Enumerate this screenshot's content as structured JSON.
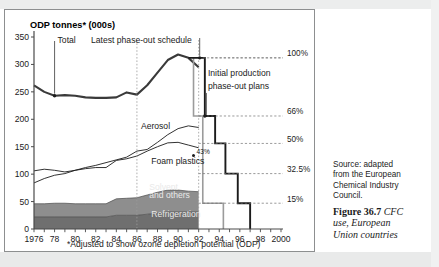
{
  "figure": {
    "axis_title": "ODP tonnes* (000s)",
    "footnote": "*Adjusted to show ozone depletion potential (ODP)"
  },
  "caption": {
    "source_line1": "Source:  adapted",
    "source_line2": "from the European",
    "source_line3": "Chemical Industry",
    "source_line4": "Council.",
    "figure_number": "Figure 36.7",
    "figure_title_line1": "CFC",
    "figure_title_line2": "use, European",
    "figure_title_line3": "Union countries"
  },
  "annotations": {
    "total": "Total",
    "latest_schedule": "Latest phase-out schedule",
    "initial_plans_line1": "Initial production",
    "initial_plans_line2": "phase-out plans",
    "aerosol": "Aerosol",
    "foam_plastics": "Foam plastics",
    "solvent_line1": "Solvent",
    "solvent_line2": "and others",
    "refrigeration": "Refrigeration",
    "pct_43": "43%"
  },
  "colors": {
    "total_line": "#3a3a3a",
    "series_line": "#1b1b1b",
    "solvent_fill": "#8e8e8e",
    "refrigeration_fill": "#6f6f6f",
    "latest_step": "#1b1b1b",
    "initial_step": "#9b9b9b",
    "axis": "#4a4a4a",
    "gridline": "#8d8f90"
  },
  "chart_data": {
    "type": "area",
    "title": "CFC use, European Union countries",
    "xlabel": "",
    "ylabel": "ODP tonnes* (000s)",
    "xlim": [
      1976,
      2000
    ],
    "ylim": [
      0,
      350
    ],
    "ytick_labels": [
      "0",
      "50",
      "100",
      "150",
      "200",
      "250",
      "300",
      "350"
    ],
    "ytick_values": [
      0,
      50,
      100,
      150,
      200,
      250,
      300,
      350
    ],
    "xtick_labels": [
      "1976",
      "78",
      "80",
      "82",
      "84",
      "86",
      "88",
      "90",
      "92",
      "94",
      "96",
      "98",
      "2000"
    ],
    "xtick_values": [
      1976,
      1978,
      1980,
      1982,
      1984,
      1986,
      1988,
      1990,
      1992,
      1994,
      1996,
      1998,
      2000
    ],
    "grid": false,
    "legend_position": "inline-labels",
    "right_axis_labels": [
      {
        "label": "100%",
        "value": 312
      },
      {
        "label": "66%",
        "value": 206
      },
      {
        "label": "50%",
        "value": 156
      },
      {
        "label": "32.5%",
        "value": 101
      },
      {
        "label": "15%",
        "value": 47
      }
    ],
    "x": [
      1976,
      1977,
      1978,
      1979,
      1980,
      1981,
      1982,
      1983,
      1984,
      1985,
      1986,
      1987,
      1988,
      1989,
      1990,
      1991,
      1992
    ],
    "series": [
      {
        "name": "Total",
        "values": [
          262,
          250,
          243,
          244,
          243,
          240,
          239,
          239,
          240,
          249,
          245,
          262,
          285,
          308,
          318,
          312,
          295
        ]
      },
      {
        "name": "Aerosol",
        "values": [
          84,
          92,
          98,
          101,
          107,
          112,
          116,
          121,
          126,
          131,
          142,
          145,
          158,
          172,
          183,
          188,
          185
        ]
      },
      {
        "name": "Foam plastics",
        "values": [
          60,
          63,
          60,
          57,
          61,
          64,
          66,
          66,
          70,
          72,
          76,
          80,
          83,
          86,
          87,
          84,
          80
        ]
      },
      {
        "name": "Solvent and others",
        "values": [
          24,
          24,
          25,
          25,
          24,
          24,
          24,
          24,
          30,
          31,
          32,
          35,
          38,
          40,
          40,
          38,
          37
        ]
      },
      {
        "name": "Refrigeration",
        "values": [
          22,
          22,
          22,
          22,
          22,
          22,
          22,
          22,
          25,
          25,
          25,
          27,
          29,
          31,
          31,
          31,
          31
        ]
      }
    ],
    "latest_phase_out_schedule": {
      "name": "Latest phase-out schedule",
      "steps": [
        {
          "year": 1991.0,
          "value": 312
        },
        {
          "year": 1992.6,
          "value": 312
        },
        {
          "year": 1992.6,
          "value": 206
        },
        {
          "year": 1993.6,
          "value": 206
        },
        {
          "year": 1993.6,
          "value": 156
        },
        {
          "year": 1994.6,
          "value": 156
        },
        {
          "year": 1994.6,
          "value": 101
        },
        {
          "year": 1995.8,
          "value": 101
        },
        {
          "year": 1995.8,
          "value": 47
        },
        {
          "year": 1997.0,
          "value": 47
        },
        {
          "year": 1997.0,
          "value": 0
        }
      ]
    },
    "initial_production_phase_out_plans": {
      "name": "Initial production phase-out plans",
      "steps": [
        {
          "year": 1991.5,
          "value": 312
        },
        {
          "year": 1991.5,
          "value": 206
        },
        {
          "year": 1992.4,
          "value": 206
        },
        {
          "year": 1992.4,
          "value": 135
        },
        {
          "year": 1992.4,
          "value": 47
        },
        {
          "year": 1994.4,
          "value": 47
        },
        {
          "year": 1994.4,
          "value": 0
        }
      ]
    },
    "marked_points": [
      {
        "label": "Total",
        "year": 1978,
        "value": 243
      },
      {
        "label": "Latest phase-out schedule",
        "year": 1992.1,
        "value": 312
      },
      {
        "label": "Initial production phase-out plans",
        "year": 1992.6,
        "value": 206
      },
      {
        "label": "43%",
        "year": 1991.5,
        "value": 134
      }
    ],
    "reference_lines": [
      {
        "type": "vertical",
        "year": 1986,
        "style": "dotted"
      },
      {
        "type": "vertical",
        "year": 1992,
        "style": "dotted"
      }
    ]
  }
}
